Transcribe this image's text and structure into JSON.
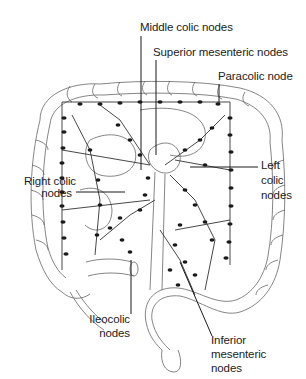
{
  "diagram": {
    "labels": {
      "middle_colic": "Middle colic nodes",
      "superior_mesenteric": "Superior mesenteric nodes",
      "paracolic": "Paracolic node",
      "right_colic_1": "Right colic",
      "right_colic_2": "nodes",
      "left_colic_1": "Left",
      "left_colic_2": "colic",
      "left_colic_3": "nodes",
      "ileocolic_1": "Ileocolic",
      "ileocolic_2": "nodes",
      "inferior_mesenteric_1": "Inferior",
      "inferior_mesenteric_2": "mesenteric",
      "inferior_mesenteric_3": "nodes"
    },
    "colors": {
      "ink": "#222222",
      "outline": "#555555",
      "node": "#1a1a1a",
      "background": "#ffffff"
    }
  }
}
